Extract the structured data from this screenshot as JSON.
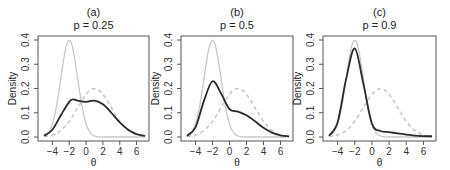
{
  "chart_data": [
    {
      "type": "line",
      "panel": "(a)",
      "title": "(a)",
      "subtitle": "p = 0.25",
      "xlabel": "θ",
      "ylabel": "Density",
      "xlim": [
        -5,
        7
      ],
      "ylim": [
        0,
        0.4
      ],
      "xticks": [
        -4,
        -2,
        0,
        2,
        4,
        6
      ],
      "yticks": [
        0.0,
        0.1,
        0.2,
        0.3,
        0.4
      ],
      "grid": false,
      "series": [
        {
          "name": "component N(-2,1)",
          "style": "solid light gray",
          "color": "#c8c8c8"
        },
        {
          "name": "component N(1,2)",
          "style": "dashed light gray",
          "color": "#c8c8c8"
        },
        {
          "name": "mixture density",
          "style": "solid dark",
          "color": "#2b2b2b",
          "x": [
            -5,
            -4,
            -3,
            -2,
            -1.5,
            -1,
            0,
            1,
            2,
            3,
            4,
            5,
            6,
            7
          ],
          "y": [
            0.005,
            0.03,
            0.09,
            0.145,
            0.155,
            0.15,
            0.145,
            0.15,
            0.135,
            0.1,
            0.06,
            0.03,
            0.012,
            0.005
          ]
        }
      ]
    },
    {
      "type": "line",
      "panel": "(b)",
      "title": "(b)",
      "subtitle": "p = 0.5",
      "xlabel": "θ",
      "ylabel": "Density",
      "xlim": [
        -5,
        7
      ],
      "ylim": [
        0,
        0.4
      ],
      "xticks": [
        -4,
        -2,
        0,
        2,
        4,
        6
      ],
      "yticks": [
        0.0,
        0.1,
        0.2,
        0.3,
        0.4
      ],
      "grid": false,
      "series": [
        {
          "name": "component N(-2,1)",
          "style": "solid light gray",
          "color": "#c8c8c8"
        },
        {
          "name": "component N(1,2)",
          "style": "dashed light gray",
          "color": "#c8c8c8"
        },
        {
          "name": "mixture density",
          "style": "solid dark",
          "color": "#2b2b2b",
          "x": [
            -5,
            -4,
            -3,
            -2,
            -1,
            0,
            1,
            2,
            3,
            4,
            5,
            6,
            7
          ],
          "y": [
            0.005,
            0.04,
            0.15,
            0.23,
            0.18,
            0.115,
            0.105,
            0.09,
            0.065,
            0.038,
            0.018,
            0.007,
            0.003
          ]
        }
      ]
    },
    {
      "type": "line",
      "panel": "(c)",
      "title": "(c)",
      "subtitle": "p = 0.9",
      "xlabel": "θ",
      "ylabel": "Density",
      "xlim": [
        -5,
        7
      ],
      "ylim": [
        0,
        0.4
      ],
      "xticks": [
        -4,
        -2,
        0,
        2,
        4,
        6
      ],
      "yticks": [
        0.0,
        0.1,
        0.2,
        0.3,
        0.4
      ],
      "grid": false,
      "series": [
        {
          "name": "component N(-2,1)",
          "style": "solid light gray",
          "color": "#c8c8c8"
        },
        {
          "name": "component N(1,2)",
          "style": "dashed light gray",
          "color": "#c8c8c8"
        },
        {
          "name": "mixture density",
          "style": "solid dark",
          "color": "#2b2b2b",
          "x": [
            -5,
            -4,
            -3,
            -2,
            -1,
            0,
            1,
            2,
            3,
            4,
            5,
            6,
            7
          ],
          "y": [
            0.005,
            0.06,
            0.24,
            0.365,
            0.22,
            0.055,
            0.025,
            0.02,
            0.015,
            0.01,
            0.006,
            0.004,
            0.003
          ]
        }
      ]
    }
  ],
  "panels": [
    {
      "title": "(a)",
      "subtitle": "p = 0.25"
    },
    {
      "title": "(b)",
      "subtitle": "p = 0.5"
    },
    {
      "title": "(c)",
      "subtitle": "p = 0.9"
    }
  ],
  "axes": {
    "ylabel": "Density",
    "xlabel": "θ",
    "xticks": [
      "-4",
      "-2",
      "0",
      "2",
      "4",
      "6"
    ],
    "yticks": [
      "0.0",
      "0.1",
      "0.2",
      "0.3",
      "0.4"
    ]
  },
  "colors": {
    "mixture": "#2b2b2b",
    "components": "#c8c8c8",
    "axis": "#555555"
  }
}
